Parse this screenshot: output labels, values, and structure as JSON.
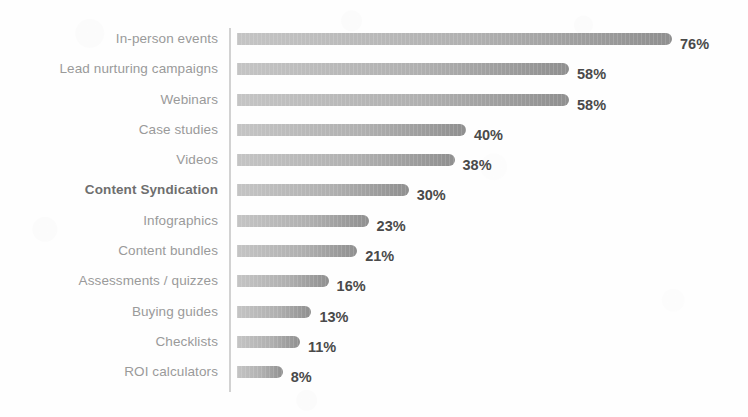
{
  "chart_data": {
    "type": "bar",
    "orientation": "horizontal",
    "title": "",
    "subtitle": "",
    "xlabel": "",
    "ylabel": "",
    "xlim": [
      0,
      76
    ],
    "grid": false,
    "legend": null,
    "value_suffix": "%",
    "categories": [
      "In-person events",
      "Lead nurturing campaigns",
      "Webinars",
      "Case studies",
      "Videos",
      "Content Syndication",
      "Infographics",
      "Content bundles",
      "Assessments / quizzes",
      "Buying guides",
      "Checklists",
      "ROI calculators"
    ],
    "values": [
      76,
      58,
      58,
      40,
      38,
      30,
      23,
      21,
      16,
      13,
      11,
      8
    ],
    "data_labels": [
      "76%",
      "58%",
      "58%",
      "40%",
      "38%",
      "30%",
      "23%",
      "21%",
      "16%",
      "13%",
      "11%",
      "8%"
    ],
    "emphasized_categories": [
      "Content Syndication"
    ],
    "colors": {
      "bar_light": "#c4c4c4",
      "bar_mid": "#b0b0b0",
      "bar_dark": "#8f8f8f",
      "axis_line": "#d2d2d2",
      "category_label": "#9a9a9a",
      "category_label_emphasis": "#6e6e6e",
      "value_label": "#4a4a4a",
      "background": "#fefefe"
    }
  }
}
